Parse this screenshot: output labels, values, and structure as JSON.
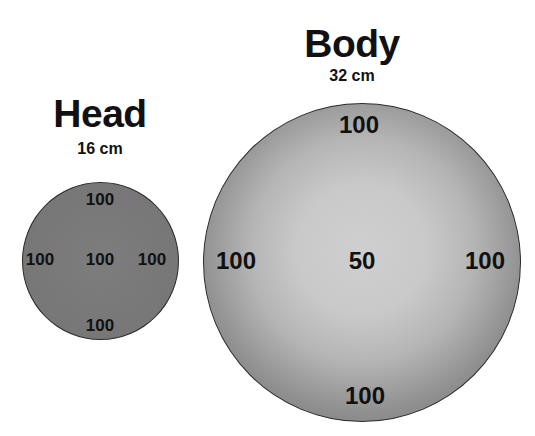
{
  "head": {
    "title": "Head",
    "diameter": "16 cm",
    "values": {
      "top": "100",
      "left": "100",
      "center": "100",
      "right": "100",
      "bottom": "100"
    }
  },
  "body": {
    "title": "Body",
    "diameter": "32 cm",
    "values": {
      "top": "100",
      "left": "100",
      "center": "50",
      "right": "100",
      "bottom": "100"
    }
  },
  "colors": {
    "head_fill": "#7a7a7a",
    "body_edge": "#757575",
    "body_center": "#cdcdcd",
    "text": "#111111"
  }
}
